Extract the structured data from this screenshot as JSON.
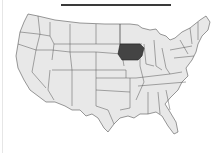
{
  "map": {
    "type": "us-states-choropleth",
    "region": "United States (contiguous)",
    "highlighted_state": "Iowa",
    "colors": {
      "default_fill": "#e8e8e8",
      "highlight_fill": "#444444",
      "border": "#555555"
    }
  },
  "title_rule": true,
  "caption": ""
}
